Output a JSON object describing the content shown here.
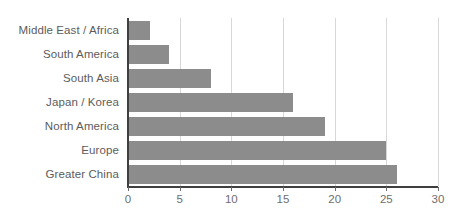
{
  "chart_data": {
    "type": "bar",
    "orientation": "horizontal",
    "title": "",
    "subtitle": "",
    "xlabel": "",
    "ylabel": "",
    "categories": [
      "Middle East / Africa",
      "South America",
      "South Asia",
      "Japan / Korea",
      "North America",
      "Europe",
      "Greater China"
    ],
    "values": [
      2.1,
      4.0,
      8.0,
      16.0,
      19.1,
      25.0,
      26.0
    ],
    "xlim": [
      0,
      30
    ],
    "xticks": [
      0,
      5,
      10,
      15,
      20,
      25,
      30
    ],
    "xtick_labels": [
      "0",
      "5",
      "10",
      "15",
      "20",
      "25",
      "30"
    ],
    "grid": true,
    "grid_axis": "x",
    "legend": false,
    "legend_position": "none",
    "bar_color": "#8c8c8c",
    "grid_color": "#d8d8d8",
    "axis_color": "#3f3f3f",
    "label_color": "#5c5c5c",
    "tick_label_color": "#6e6e6e",
    "background_color": "#ffffff"
  }
}
